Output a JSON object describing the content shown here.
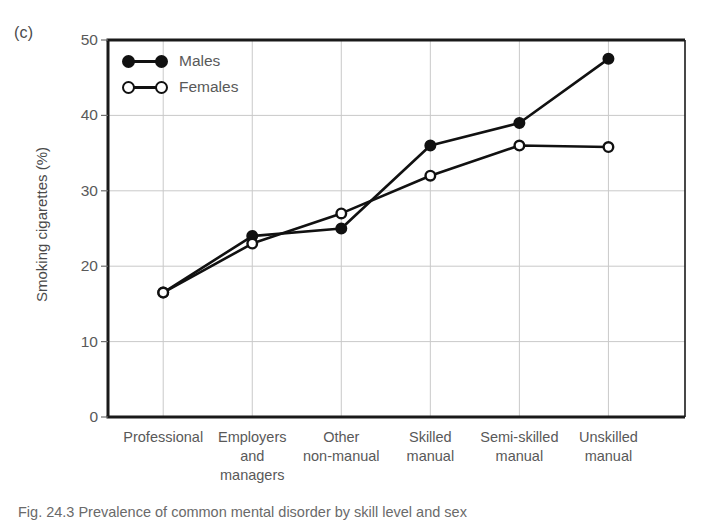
{
  "panel": {
    "label": "(c)"
  },
  "axes": {
    "ylabel": "Smoking cigarettes (%)",
    "yticks": [
      "0",
      "10",
      "20",
      "30",
      "40",
      "50"
    ],
    "xticks": [
      "Professional",
      "Employers\nand\nmanagers",
      "Other\nnon-manual",
      "Skilled\nmanual",
      "Semi-skilled\nmanual",
      "Unskilled\nmanual"
    ]
  },
  "legend": {
    "entries": [
      {
        "label": "Males",
        "marker": "filled-circle"
      },
      {
        "label": "Females",
        "marker": "open-circle"
      }
    ]
  },
  "caption": {
    "text": "Fig. 24.3   Prevalence of common mental disorder by skill level and sex"
  },
  "colors": {
    "line": "#111111",
    "grid": "#c9c9c9",
    "axis": "#1a1a1a",
    "text": "#595959"
  },
  "chart_data": {
    "type": "line",
    "title": "",
    "xlabel": "",
    "ylabel": "Smoking cigarettes (%)",
    "ylim": [
      0,
      50
    ],
    "yticks": [
      0,
      10,
      20,
      30,
      40,
      50
    ],
    "grid": true,
    "legend_position": "top-left-inside",
    "categories": [
      "Professional",
      "Employers and managers",
      "Other non-manual",
      "Skilled manual",
      "Semi-skilled manual",
      "Unskilled manual"
    ],
    "series": [
      {
        "name": "Males",
        "marker": "filled-circle",
        "values": [
          16.5,
          24.0,
          25.0,
          36.0,
          39.0,
          47.5
        ]
      },
      {
        "name": "Females",
        "marker": "open-circle",
        "values": [
          16.5,
          23.0,
          27.0,
          32.0,
          36.0,
          35.8
        ]
      }
    ]
  }
}
